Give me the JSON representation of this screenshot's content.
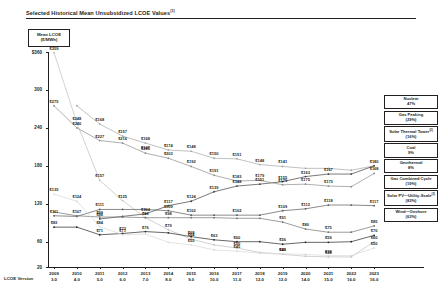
{
  "title": "Selected Historical Mean Unsubsidized LCOE Values",
  "title_footnote": "(1)",
  "unit_box": {
    "line1": "Mean LCOE",
    "line2": "($/MWh)"
  },
  "axes": {
    "y_ticks": [
      "$360",
      "300",
      "240",
      "180",
      "120",
      "60",
      "20"
    ],
    "y_values": [
      360,
      300,
      240,
      180,
      120,
      60,
      20
    ],
    "y_min": 20,
    "y_max": 360,
    "x_caption": "LCOE Version",
    "x_years": [
      "2009",
      "2010",
      "2011",
      "2012",
      "2013",
      "2014",
      "2015",
      "2016",
      "2017",
      "2018",
      "2019",
      "2020",
      "2021",
      "2022",
      "2023"
    ],
    "x_versions": [
      "3.0",
      "4.0",
      "5.0",
      "6.0",
      "7.0",
      "8.0",
      "9.0",
      "10.0",
      "11.0",
      "12.0",
      "13.0",
      "14.0",
      "15.0",
      "16.0",
      "16.0"
    ]
  },
  "legend": [
    {
      "name": "Nuclear",
      "pct": "47%",
      "footnote": ""
    },
    {
      "name": "Gas Peaking",
      "pct": "(29%)",
      "footnote": ""
    },
    {
      "name": "Solar Thermal Tower",
      "pct": "(16%)",
      "footnote": "(2)"
    },
    {
      "name": "Coal",
      "pct": "9%",
      "footnote": ""
    },
    {
      "name": "Geothermal",
      "pct": "8%",
      "footnote": ""
    },
    {
      "name": "Gas Combined Cycle",
      "pct": "(19%)",
      "footnote": ""
    },
    {
      "name": "Solar PV—Utility-Scale",
      "pct": "(83%)",
      "footnote": "(3)"
    },
    {
      "name": "Wind—Onshore",
      "pct": "(63%)",
      "footnote": ""
    }
  ],
  "chart_data": {
    "type": "line",
    "title": "Selected Historical Mean Unsubsidized LCOE Values",
    "xlabel": "LCOE Version",
    "ylabel": "Mean LCOE ($/MWh)",
    "ylim": [
      20,
      360
    ],
    "grid": false,
    "legend_position": "right",
    "x": [
      "2009",
      "2010",
      "2011",
      "2012",
      "2013",
      "2014",
      "2015",
      "2016",
      "2017",
      "2018",
      "2019",
      "2020",
      "2021",
      "2022",
      "2023"
    ],
    "series": [
      {
        "name": "Solar Thermal Tower",
        "color": "#a6a6a6",
        "values": [
          null,
          275,
          246,
          227,
          216,
          205,
          203,
          192,
          191,
          182,
          179,
          176,
          176,
          173,
          180
        ]
      },
      {
        "name": "Solar PV—Utility-Scale",
        "color": "#bfbfbf",
        "values": [
          359,
          248,
          157,
          125,
          98,
          79,
          64,
          55,
          50,
          43,
          40,
          37,
          36,
          36,
          60
        ]
      },
      {
        "name": "Nuclear",
        "color": "#404040",
        "values": [
          null,
          null,
          96,
          100,
          104,
          117,
          124,
          139,
          148,
          151,
          155,
          163,
          167,
          167,
          180
        ]
      },
      {
        "name": "Gas Peaking",
        "color": "#8c8c8c",
        "values": [
          275,
          240,
          220,
          216,
          200,
          192,
          179,
          165,
          156,
          157,
          150,
          151,
          148,
          147,
          168
        ]
      },
      {
        "name": "Coal",
        "color": "#595959",
        "values": [
          101,
          100,
          111,
          111,
          111,
          109,
          102,
          102,
          102,
          102,
          109,
          112,
          118,
          118,
          117
        ]
      },
      {
        "name": "Geothermal",
        "color": "#737373",
        "values": [
          107,
          101,
          99,
          99,
          98,
          98,
          98,
          98,
          97,
          97,
          91,
          80,
          75,
          75,
          85
        ]
      },
      {
        "name": "Gas Combined Cycle",
        "color": "#262626",
        "values": [
          83,
          83,
          71,
          73,
          76,
          74,
          68,
          63,
          60,
          60,
          56,
          59,
          59,
          60,
          70
        ]
      },
      {
        "name": "Wind—Onshore",
        "color": "#d9d9d9",
        "values": [
          135,
          124,
          84,
          71,
          72,
          59,
          55,
          47,
          45,
          42,
          41,
          40,
          38,
          38,
          50
        ]
      }
    ],
    "point_labels": [
      {
        "series": "Solar PV—Utility-Scale",
        "x": "2009",
        "text": "$359"
      },
      {
        "series": "Gas Peaking",
        "x": "2009",
        "text": "$275"
      },
      {
        "series": "Solar PV—Utility-Scale",
        "x": "2010",
        "text": "$248"
      },
      {
        "series": "Gas Peaking",
        "x": "2010",
        "text": "$240"
      },
      {
        "series": "Gas Peaking",
        "x": "2011",
        "text": "$227"
      },
      {
        "series": "Gas Peaking",
        "x": "2012",
        "text": "$216"
      },
      {
        "series": "Gas Peaking",
        "x": "2013",
        "text": "$205"
      },
      {
        "series": "Gas Peaking",
        "x": "2014",
        "text": "$203"
      },
      {
        "series": "Gas Peaking",
        "x": "2015",
        "text": "$192"
      },
      {
        "series": "Gas Peaking",
        "x": "2016",
        "text": "$191"
      },
      {
        "series": "Gas Peaking",
        "x": "2017",
        "text": "$183"
      },
      {
        "series": "Gas Peaking",
        "x": "2018",
        "text": "$179"
      },
      {
        "series": "Gas Peaking",
        "x": "2019",
        "text": "$179"
      },
      {
        "series": "Gas Peaking",
        "x": "2020",
        "text": "$175"
      },
      {
        "series": "Gas Peaking",
        "x": "2021",
        "text": "$173"
      },
      {
        "series": "Gas Peaking",
        "x": "2023",
        "text": "$168"
      },
      {
        "series": "Solar Thermal Tower",
        "x": "2011",
        "text": "$168"
      },
      {
        "series": "Solar Thermal Tower",
        "x": "2012",
        "text": "$157"
      },
      {
        "series": "Solar Thermal Tower",
        "x": "2013",
        "text": "$168"
      },
      {
        "series": "Solar Thermal Tower",
        "x": "2013",
        "text": "$147"
      },
      {
        "series": "Solar Thermal Tower",
        "x": "2014",
        "text": "$174"
      },
      {
        "series": "Solar Thermal Tower",
        "x": "2015",
        "text": "$148"
      },
      {
        "series": "Solar Thermal Tower",
        "x": "2016",
        "text": "$150"
      },
      {
        "series": "Solar Thermal Tower",
        "x": "2017",
        "text": "$151"
      },
      {
        "series": "Solar Thermal Tower",
        "x": "2018",
        "text": "$148"
      },
      {
        "series": "Solar Thermal Tower",
        "x": "2019",
        "text": "$141"
      },
      {
        "series": "Nuclear",
        "x": "2011",
        "text": "$96"
      },
      {
        "series": "Nuclear",
        "x": "2013",
        "text": "$104"
      },
      {
        "series": "Nuclear",
        "x": "2014",
        "text": "$117"
      },
      {
        "series": "Nuclear",
        "x": "2015",
        "text": "$124"
      },
      {
        "series": "Nuclear",
        "x": "2016",
        "text": "$139"
      },
      {
        "series": "Nuclear",
        "x": "2017",
        "text": "$148"
      },
      {
        "series": "Nuclear",
        "x": "2018",
        "text": "$151"
      },
      {
        "series": "Nuclear",
        "x": "2019",
        "text": "$155"
      },
      {
        "series": "Nuclear",
        "x": "2020",
        "text": "$163"
      },
      {
        "series": "Nuclear",
        "x": "2021",
        "text": "$167"
      },
      {
        "series": "Nuclear",
        "x": "2023",
        "text": "$180"
      },
      {
        "series": "Coal",
        "x": "2009",
        "text": "$111"
      },
      {
        "series": "Coal",
        "x": "2011",
        "text": "$111"
      },
      {
        "series": "Coal",
        "x": "2014",
        "text": "$109"
      },
      {
        "series": "Coal",
        "x": "2015",
        "text": "$102"
      },
      {
        "series": "Coal",
        "x": "2017",
        "text": "$102"
      },
      {
        "series": "Coal",
        "x": "2019",
        "text": "$109"
      },
      {
        "series": "Coal",
        "x": "2020",
        "text": "$112"
      },
      {
        "series": "Coal",
        "x": "2021",
        "text": "$118"
      },
      {
        "series": "Coal",
        "x": "2023",
        "text": "$117"
      },
      {
        "series": "Geothermal",
        "x": "2010",
        "text": "$107"
      },
      {
        "series": "Geothermal",
        "x": "2011",
        "text": "$99"
      },
      {
        "series": "Geothermal",
        "x": "2014",
        "text": "$98"
      },
      {
        "series": "Geothermal",
        "x": "2019",
        "text": "$91"
      },
      {
        "series": "Geothermal",
        "x": "2020",
        "text": "$80"
      },
      {
        "series": "Geothermal",
        "x": "2021",
        "text": "$75"
      },
      {
        "series": "Geothermal",
        "x": "2023",
        "text": "$85"
      },
      {
        "series": "Gas Combined Cycle",
        "x": "2009",
        "text": "$83"
      },
      {
        "series": "Gas Combined Cycle",
        "x": "2011",
        "text": "$71"
      },
      {
        "series": "Gas Combined Cycle",
        "x": "2012",
        "text": "$73"
      },
      {
        "series": "Gas Combined Cycle",
        "x": "2013",
        "text": "$76"
      },
      {
        "series": "Gas Combined Cycle",
        "x": "2015",
        "text": "$68"
      },
      {
        "series": "Gas Combined Cycle",
        "x": "2016",
        "text": "$63"
      },
      {
        "series": "Gas Combined Cycle",
        "x": "2017",
        "text": "$60"
      },
      {
        "series": "Gas Combined Cycle",
        "x": "2019",
        "text": "$56"
      },
      {
        "series": "Gas Combined Cycle",
        "x": "2021",
        "text": "$59"
      },
      {
        "series": "Gas Combined Cycle",
        "x": "2023",
        "text": "$70"
      },
      {
        "series": "Wind—Onshore",
        "x": "2009",
        "text": "$135"
      },
      {
        "series": "Wind—Onshore",
        "x": "2010",
        "text": "$124"
      },
      {
        "series": "Wind—Onshore",
        "x": "2011",
        "text": "$84"
      },
      {
        "series": "Wind—Onshore",
        "x": "2012",
        "text": "$71"
      },
      {
        "series": "Wind—Onshore",
        "x": "2015",
        "text": "$55"
      },
      {
        "series": "Wind—Onshore",
        "x": "2017",
        "text": "$45"
      },
      {
        "series": "Wind—Onshore",
        "x": "2019",
        "text": "$41"
      },
      {
        "series": "Wind—Onshore",
        "x": "2021",
        "text": "$38"
      },
      {
        "series": "Wind—Onshore",
        "x": "2023",
        "text": "$50"
      },
      {
        "series": "Solar PV—Utility-Scale",
        "x": "2011",
        "text": "$157"
      },
      {
        "series": "Solar PV—Utility-Scale",
        "x": "2012",
        "text": "$125"
      },
      {
        "series": "Solar PV—Utility-Scale",
        "x": "2013",
        "text": "$98"
      },
      {
        "series": "Solar PV—Utility-Scale",
        "x": "2014",
        "text": "$79"
      },
      {
        "series": "Solar PV—Utility-Scale",
        "x": "2015",
        "text": "$64"
      },
      {
        "series": "Solar PV—Utility-Scale",
        "x": "2017",
        "text": "$50"
      },
      {
        "series": "Solar PV—Utility-Scale",
        "x": "2019",
        "text": "$40"
      },
      {
        "series": "Solar PV—Utility-Scale",
        "x": "2021",
        "text": "$36"
      },
      {
        "series": "Solar PV—Utility-Scale",
        "x": "2023",
        "text": "$60"
      }
    ]
  }
}
